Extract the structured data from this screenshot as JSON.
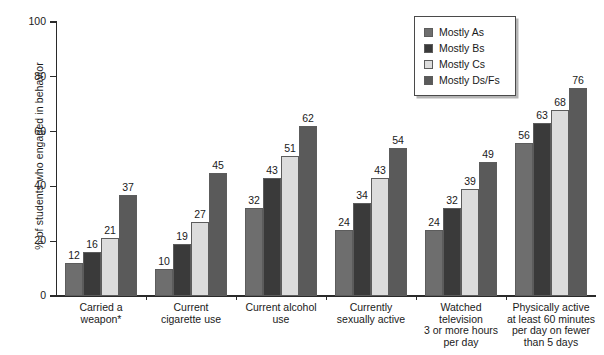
{
  "chart_data": {
    "type": "bar",
    "title": "",
    "xlabel": "",
    "ylabel": "% of students who engaged in behavior",
    "ylim": [
      0,
      100
    ],
    "yticks": [
      0,
      20,
      40,
      60,
      80,
      100
    ],
    "grid": false,
    "legend_position": "top-right",
    "categories": [
      "Carried a\nweapon*",
      "Current\ncigarette use",
      "Current alcohol\nuse",
      "Currently\nsexually active",
      "Watched\ntelevision\n3 or more hours\nper day",
      "Physically active\nat least 60 minutes\nper day on fewer\nthan 5 days"
    ],
    "series": [
      {
        "name": "Mostly As",
        "color": "#6e6e6e",
        "values": [
          12,
          10,
          32,
          24,
          24,
          56
        ]
      },
      {
        "name": "Mostly Bs",
        "color": "#3a3a3a",
        "values": [
          16,
          19,
          43,
          34,
          32,
          63
        ]
      },
      {
        "name": "Mostly Cs",
        "color": "#dcdcdc",
        "values": [
          21,
          27,
          51,
          43,
          39,
          68
        ]
      },
      {
        "name": "Mostly Ds/Fs",
        "color": "#5a5a5a",
        "values": [
          37,
          45,
          62,
          54,
          49,
          76
        ]
      }
    ]
  },
  "legend": {
    "items": [
      {
        "label": "Mostly As"
      },
      {
        "label": "Mostly Bs"
      },
      {
        "label": "Mostly Cs"
      },
      {
        "label": "Mostly Ds/Fs"
      }
    ]
  },
  "axis": {
    "y_title": "% of students who engaged in behavior",
    "y_labels": [
      "100",
      "80",
      "60",
      "40",
      "20",
      "0"
    ]
  },
  "categories_display": [
    [
      "Carried a",
      "weapon*"
    ],
    [
      "Current",
      "cigarette use"
    ],
    [
      "Current alcohol",
      "use"
    ],
    [
      "Currently",
      "sexually active"
    ],
    [
      "Watched",
      "television",
      "3 or more hours",
      "per day"
    ],
    [
      "Physically active",
      "at least 60 minutes",
      "per day on fewer",
      "than 5 days"
    ]
  ]
}
